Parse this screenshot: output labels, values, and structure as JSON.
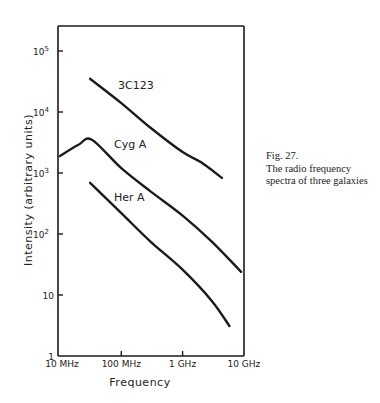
{
  "chart_data": {
    "type": "line",
    "title": "",
    "xlabel": "Frequency",
    "ylabel": "Intensity (arbitrary units)",
    "xscale": "log",
    "yscale": "log",
    "xlim_hz": [
      10000000,
      10000000000
    ],
    "ylim": [
      1,
      300000
    ],
    "x_ticks": [
      {
        "label": "10 MHz",
        "value_hz": 10000000
      },
      {
        "label": "100 MHz",
        "value_hz": 100000000
      },
      {
        "label": "1 GHz",
        "value_hz": 1000000000
      },
      {
        "label": "10 GHz",
        "value_hz": 10000000000
      }
    ],
    "y_ticks": [
      {
        "label": "1",
        "value": 1
      },
      {
        "label": "10",
        "value": 10
      },
      {
        "label": "10^2",
        "base": "10",
        "exp": "2",
        "value": 100
      },
      {
        "label": "10^3",
        "base": "10",
        "exp": "3",
        "value": 1000
      },
      {
        "label": "10^4",
        "base": "10",
        "exp": "4",
        "value": 10000
      },
      {
        "label": "10^5",
        "base": "10",
        "exp": "5",
        "value": 100000
      }
    ],
    "grid": false,
    "legend": "inline labels",
    "series": [
      {
        "name": "3C123",
        "points": [
          {
            "f_mhz": 31,
            "intensity": 35000
          },
          {
            "f_mhz": 100,
            "intensity": 14000
          },
          {
            "f_mhz": 300,
            "intensity": 5500
          },
          {
            "f_mhz": 1000,
            "intensity": 2200
          },
          {
            "f_mhz": 2000,
            "intensity": 1500
          },
          {
            "f_mhz": 4400,
            "intensity": 830
          }
        ]
      },
      {
        "name": "Cyg A",
        "points": [
          {
            "f_mhz": 10,
            "intensity": 1900
          },
          {
            "f_mhz": 20,
            "intensity": 2900
          },
          {
            "f_mhz": 33,
            "intensity": 3500
          },
          {
            "f_mhz": 100,
            "intensity": 1200
          },
          {
            "f_mhz": 300,
            "intensity": 500
          },
          {
            "f_mhz": 1000,
            "intensity": 200
          },
          {
            "f_mhz": 3000,
            "intensity": 75
          },
          {
            "f_mhz": 9000,
            "intensity": 24
          }
        ]
      },
      {
        "name": "Her A",
        "points": [
          {
            "f_mhz": 31,
            "intensity": 690
          },
          {
            "f_mhz": 100,
            "intensity": 220
          },
          {
            "f_mhz": 300,
            "intensity": 75
          },
          {
            "f_mhz": 1000,
            "intensity": 26
          },
          {
            "f_mhz": 3000,
            "intensity": 8
          },
          {
            "f_mhz": 5800,
            "intensity": 3.1
          }
        ]
      }
    ]
  },
  "caption": {
    "line1": "Fig. 27.",
    "line2": "The radio frequency",
    "line3": "spectra of three galaxies"
  }
}
